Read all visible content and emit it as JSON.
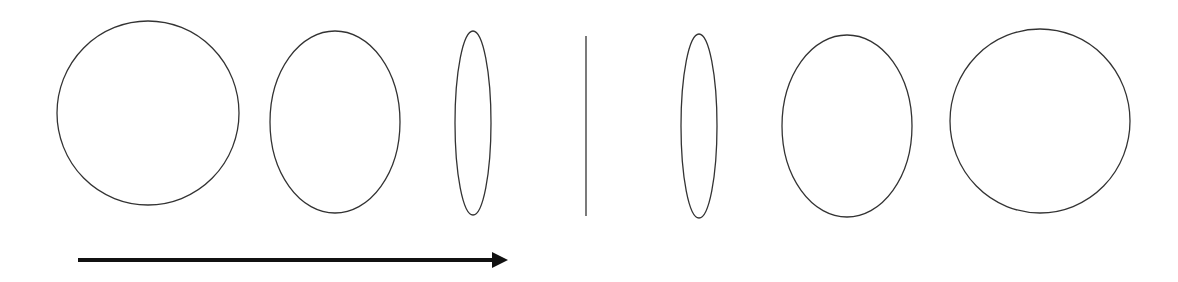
{
  "diagram": {
    "stroke_color": "#333333",
    "arrow_color": "#111111",
    "shapes": [
      {
        "id": "circle-left",
        "cx": 148,
        "cy": 113,
        "rx": 91,
        "ry": 92
      },
      {
        "id": "ellipse-left",
        "cx": 335,
        "cy": 122,
        "rx": 65,
        "ry": 91
      },
      {
        "id": "thin-ellipse-left",
        "cx": 473,
        "cy": 123,
        "rx": 18,
        "ry": 92
      },
      {
        "id": "thin-ellipse-right",
        "cx": 699,
        "cy": 126,
        "rx": 18,
        "ry": 92
      },
      {
        "id": "ellipse-right",
        "cx": 847,
        "cy": 126,
        "rx": 65,
        "ry": 91
      },
      {
        "id": "circle-right",
        "cx": 1040,
        "cy": 121,
        "rx": 90,
        "ry": 92
      }
    ],
    "center_line": {
      "x": 586,
      "y1": 36,
      "y2": 216
    },
    "arrow": {
      "x1": 78,
      "x2": 508,
      "y": 260,
      "direction": "right"
    }
  }
}
